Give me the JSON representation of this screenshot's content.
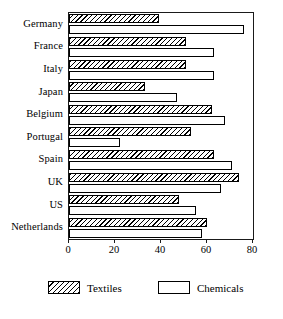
{
  "chart_data": {
    "type": "bar",
    "orientation": "horizontal",
    "title": "",
    "xlabel": "",
    "ylabel": "",
    "xlim": [
      0,
      80
    ],
    "xticks": [
      0,
      20,
      40,
      60,
      80
    ],
    "xtick_labels": [
      "0",
      "20",
      "40",
      "60",
      "80"
    ],
    "grid": false,
    "legend_position": "bottom",
    "categories": [
      "Germany",
      "France",
      "Italy",
      "Japan",
      "Belgium",
      "Portugal",
      "Spain",
      "UK",
      "US",
      "Netherlands"
    ],
    "series": [
      {
        "name": "Textiles",
        "fill": "diagonal-hatch",
        "values": [
          39,
          51,
          51,
          33,
          62,
          53,
          63,
          74,
          48,
          60
        ]
      },
      {
        "name": "Chemicals",
        "fill": "white",
        "values": [
          76,
          63,
          63,
          47,
          68,
          22,
          71,
          66,
          55,
          58
        ]
      }
    ]
  },
  "legend": {
    "entries": [
      {
        "label": "Textiles"
      },
      {
        "label": "Chemicals"
      }
    ]
  },
  "colors": {
    "axis": "#1a1a1a",
    "bar_outline": "#000000",
    "bar_fill_chemicals": "#ffffff",
    "background": "#ffffff"
  }
}
